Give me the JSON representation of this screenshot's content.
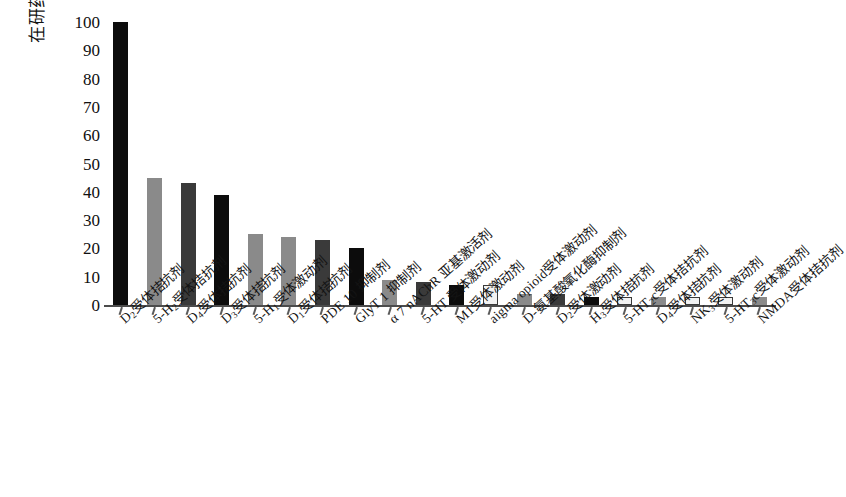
{
  "chart_data": {
    "type": "bar",
    "title": "",
    "subtitle": "",
    "xlabel": "",
    "ylabel": "在研药物数量/种",
    "ylim": [
      0,
      100
    ],
    "yticks": [
      0,
      10,
      20,
      30,
      40,
      50,
      60,
      70,
      80,
      90,
      100
    ],
    "grid": false,
    "legend": "none",
    "categories": [
      "D₂受体拮抗剂",
      "5-H₂受体拮抗剂",
      "D₄受体拮抗剂",
      "D₃受体拮抗剂",
      "5-H₁受体激动剂",
      "D₁受体拮抗剂",
      "PDE 10 抑制剂",
      "GlyT 1 抑制剂",
      "α 7 nAChR 亚基激活剂",
      "5-HT 受体激动剂",
      "M1受体激动剂",
      "aigma opioid受体激动剂",
      "D-氨基酸氧化酶抑制剂",
      "D₂受体激动剂",
      "H₃受体拮抗剂",
      "5-HT₂c受体拮抗剂",
      "D₄受体拮抗剂",
      "NK₃受体激动剂",
      "5-HT₃c受体激动剂",
      "NMDA受体拮抗剂"
    ],
    "values": [
      100,
      45,
      43,
      39,
      25,
      24,
      23,
      20,
      9,
      8,
      7,
      7,
      4,
      4,
      3,
      3,
      3,
      3,
      3,
      3
    ],
    "bar_styles": [
      "black",
      "mid",
      "dark",
      "black",
      "mid",
      "mid",
      "dark",
      "black",
      "mid",
      "dark",
      "black",
      "light",
      "mid",
      "dark",
      "black",
      "light",
      "mid",
      "light",
      "light",
      "mid"
    ],
    "colors": {
      "black": "#0c0c0c",
      "dark": "#3a3a3a",
      "mid": "#8a8a8a",
      "light": "#f2f2f2",
      "axis": "#4c4c4c",
      "text": "#111111"
    }
  }
}
